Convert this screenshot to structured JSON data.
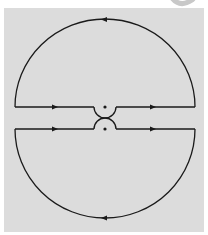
{
  "figure": {
    "type": "contour-integration-diagram",
    "colors": {
      "background": "#ffffff",
      "panel": "#dcdcdc",
      "stroke": "#1a1a1a",
      "corner_glyph": "#c8c8c8"
    },
    "upper_contour": {
      "big_arc": {
        "direction": "counterclockwise",
        "arrow_position": "top",
        "arrow_points": "left"
      },
      "axis_segments": [
        {
          "side": "left",
          "arrow_points": "right"
        },
        {
          "side": "right",
          "arrow_points": "right"
        }
      ],
      "indent": {
        "shape": "small semicircle below axis",
        "center_point": "dot"
      }
    },
    "lower_contour": {
      "big_arc": {
        "direction": "clockwise",
        "arrow_position": "bottom",
        "arrow_points": "left"
      },
      "axis_segments": [
        {
          "side": "left",
          "arrow_points": "right"
        },
        {
          "side": "right",
          "arrow_points": "right"
        }
      ],
      "indent": {
        "shape": "small semicircle above axis",
        "center_point": "dot"
      }
    }
  }
}
